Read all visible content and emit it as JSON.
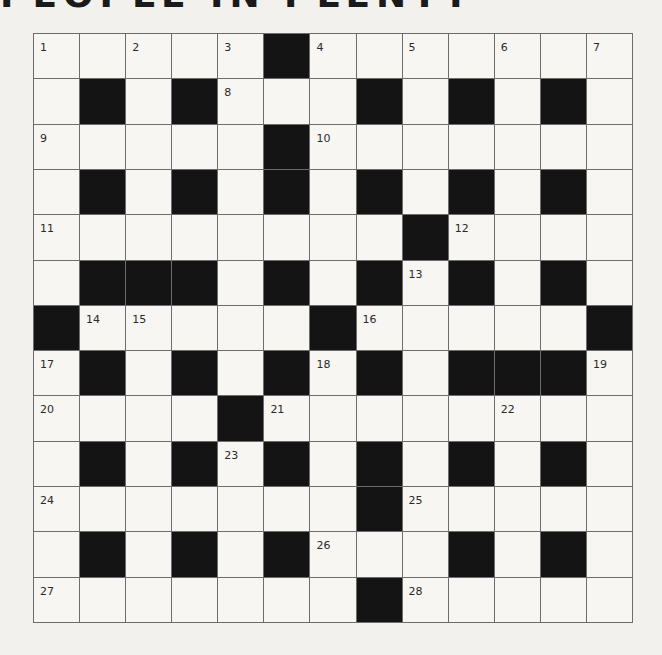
{
  "puzzle": {
    "title": "PEOPLE IN PLENTY",
    "size": 13,
    "rows": [
      [
        "1",
        "",
        "2",
        "",
        "3",
        "#",
        "4",
        "",
        "5",
        "",
        "6",
        "",
        "7"
      ],
      [
        "",
        "#",
        "",
        "#",
        "8",
        "",
        "",
        "#",
        "",
        "#",
        "",
        "#",
        ""
      ],
      [
        "9",
        "",
        "",
        "",
        "",
        "#",
        "10",
        "",
        "",
        "",
        "",
        "",
        ""
      ],
      [
        "",
        "#",
        "",
        "#",
        "",
        "#",
        "",
        "#",
        "",
        "#",
        "",
        "#",
        ""
      ],
      [
        "11",
        "",
        "",
        "",
        "",
        "",
        "",
        "",
        "#",
        "12",
        "",
        "",
        ""
      ],
      [
        "",
        "#",
        "#",
        "#",
        "",
        "#",
        "",
        "#",
        "13",
        "#",
        "",
        "#",
        ""
      ],
      [
        "#",
        "14",
        "15",
        "",
        "",
        "",
        "#",
        "16",
        "",
        "",
        "",
        "",
        "#"
      ],
      [
        "17",
        "#",
        "",
        "#",
        "",
        "#",
        "18",
        "#",
        "",
        "#",
        "#",
        "#",
        "19"
      ],
      [
        "20",
        "",
        "",
        "",
        "#",
        "21",
        "",
        "",
        "",
        "",
        "22",
        "",
        ""
      ],
      [
        "",
        "#",
        "",
        "#",
        "23",
        "#",
        "",
        "#",
        "",
        "#",
        "",
        "#",
        ""
      ],
      [
        "24",
        "",
        "",
        "",
        "",
        "",
        "",
        "#",
        "25",
        "",
        "",
        "",
        ""
      ],
      [
        "",
        "#",
        "",
        "#",
        "",
        "#",
        "26",
        "",
        "",
        "#",
        "",
        "#",
        ""
      ],
      [
        "27",
        "",
        "",
        "",
        "",
        "",
        "",
        "#",
        "28",
        "",
        "",
        "",
        ""
      ]
    ]
  },
  "colors": {
    "black_square": "#141414",
    "white_square": "#f7f6f3",
    "grid_line": "#6d6d6d",
    "background": "#f2f1ee"
  }
}
